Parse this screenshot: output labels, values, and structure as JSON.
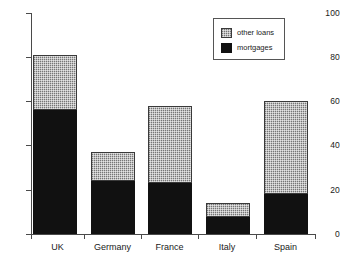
{
  "chart_data": {
    "type": "bar",
    "subtype": "stacked-vertical",
    "title": "",
    "xlabel": "",
    "ylabel": "",
    "categories": [
      "UK",
      "Germany",
      "France",
      "Italy",
      "Spain"
    ],
    "series": [
      {
        "name": "mortgages",
        "values": [
          56,
          24,
          23,
          7.5,
          18
        ],
        "color": "#111111"
      },
      {
        "name": "other loans",
        "values": [
          25,
          13,
          35,
          6.5,
          42
        ],
        "color": "#a9a9a9"
      }
    ],
    "totals": [
      81,
      37,
      58,
      14,
      60
    ],
    "ylim": [
      0,
      100
    ],
    "yticks": [
      0,
      20,
      40,
      60,
      80,
      100
    ],
    "ytick_labels": [
      "0",
      "20",
      "40",
      "60",
      "80",
      "100"
    ],
    "grid": false,
    "legend": {
      "position": "top-right",
      "entries": [
        {
          "label": "other loans",
          "swatch": "other"
        },
        {
          "label": "mortgages",
          "swatch": "mortgages"
        }
      ]
    }
  },
  "axes": {
    "y": {
      "ticks": [
        {
          "label": "100",
          "value": 100
        },
        {
          "label": "80",
          "value": 80
        },
        {
          "label": "60",
          "value": 60
        },
        {
          "label": "40",
          "value": 40
        },
        {
          "label": "20",
          "value": 20
        },
        {
          "label": "0",
          "value": 0
        }
      ]
    },
    "x": {
      "ticks": [
        {
          "label": "UK"
        },
        {
          "label": "Germany"
        },
        {
          "label": "France"
        },
        {
          "label": "Italy"
        },
        {
          "label": "Spain"
        }
      ]
    }
  }
}
